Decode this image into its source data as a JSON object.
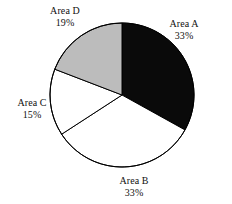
{
  "chart_data": {
    "type": "pie",
    "title": "",
    "subtitle": "",
    "xlabel": "",
    "ylabel": "",
    "legend_position": "none",
    "grid": false,
    "start_angle_deg": 0,
    "direction": "clockwise",
    "center": {
      "x": 122,
      "y": 95
    },
    "radius": 72,
    "categories": [
      "Area A",
      "Area B",
      "Area C",
      "Area D"
    ],
    "values": [
      33,
      33,
      15,
      19
    ],
    "value_unit": "%",
    "slices": [
      {
        "name": "Area A",
        "value": 33,
        "value_label": "33%",
        "color": "#0a0a0a",
        "stroke": "#000000",
        "start_angle_deg": 0,
        "end_angle_deg": 119
      },
      {
        "name": "Area B",
        "value": 33,
        "value_label": "33%",
        "color": "#ffffff",
        "stroke": "#000000",
        "start_angle_deg": 119,
        "end_angle_deg": 237
      },
      {
        "name": "Area C",
        "value": 15,
        "value_label": "15%",
        "color": "#ffffff",
        "stroke": "#000000",
        "start_angle_deg": 237,
        "end_angle_deg": 291
      },
      {
        "name": "Area D",
        "value": 19,
        "value_label": "19%",
        "color": "#bcbcbc",
        "stroke": "#000000",
        "start_angle_deg": 291,
        "end_angle_deg": 360
      }
    ]
  },
  "labels": {
    "area_a": {
      "name": "Area A",
      "percent": "33%"
    },
    "area_b": {
      "name": "Area B",
      "percent": "33%"
    },
    "area_c": {
      "name": "Area C",
      "percent": "15%"
    },
    "area_d": {
      "name": "Area D",
      "percent": "19%"
    }
  },
  "colors": {
    "background": "#ffffff",
    "outline": "#000000",
    "slice_dark": "#0a0a0a",
    "slice_gray": "#bcbcbc",
    "slice_white": "#ffffff",
    "text": "#111111"
  }
}
